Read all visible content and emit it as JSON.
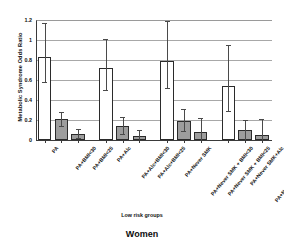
{
  "chart_data": {
    "type": "bar",
    "title": "",
    "caption": "Women",
    "xlabel": "Low risk groups",
    "ylabel": "Metabolic Syndrome Odds Ratio",
    "ylim": [
      0,
      1.2
    ],
    "ytick_labels": [
      "0",
      "0.2",
      "0.4",
      "0.6",
      "0.8",
      "1",
      "1.2"
    ],
    "ytick_values": [
      0,
      0.2,
      0.4,
      0.6,
      0.8,
      1.0,
      1.2
    ],
    "grid": "horizontal",
    "legend": "none",
    "categories": [
      "PA",
      "PA+BMI<30",
      "PA+BMI<25",
      "PA+Alc",
      "PA+Alc+BMI<30",
      "PA+Alc+BMI<25",
      "PA+Never SMK",
      "PA+Never SMK + BMI<30",
      "PA+Never SMK + BMI<25",
      "PA+Never SMK+Alc",
      "PA+Never SMK+Alc+BMI<30",
      "PA+Never SMK+Alc+BMI<25"
    ],
    "values": [
      0.83,
      0.21,
      0.06,
      0.72,
      0.14,
      0.04,
      0.79,
      0.19,
      0.08,
      0.54,
      0.1,
      0.05
    ],
    "error_low": [
      0.58,
      0.14,
      0.02,
      0.5,
      0.06,
      0.0,
      0.52,
      0.09,
      0.0,
      0.29,
      0.0,
      0.0
    ],
    "error_high": [
      1.17,
      0.28,
      0.11,
      1.01,
      0.23,
      0.1,
      1.19,
      0.31,
      0.22,
      0.95,
      0.2,
      0.21
    ],
    "bar_fills": [
      "white",
      "gray",
      "gray",
      "white",
      "gray",
      "gray",
      "white",
      "gray",
      "gray",
      "white",
      "gray",
      "gray"
    ],
    "groups": [
      {
        "name": "PA",
        "indices": [
          0,
          1,
          2
        ]
      },
      {
        "name": "PA+Alc",
        "indices": [
          3,
          4,
          5
        ]
      },
      {
        "name": "PA+Never SMK",
        "indices": [
          6,
          7,
          8
        ]
      },
      {
        "name": "PA+Never SMK+Alc",
        "indices": [
          9,
          10,
          11
        ]
      }
    ]
  },
  "colors": {
    "bar_white": "#ffffff",
    "bar_gray": "#9d9d9d",
    "bar_edge": "#2b2b2b",
    "gridline": "#a8a8a8",
    "axis": "#3a3a3a",
    "text": "#111111",
    "background": "#ffffff"
  }
}
